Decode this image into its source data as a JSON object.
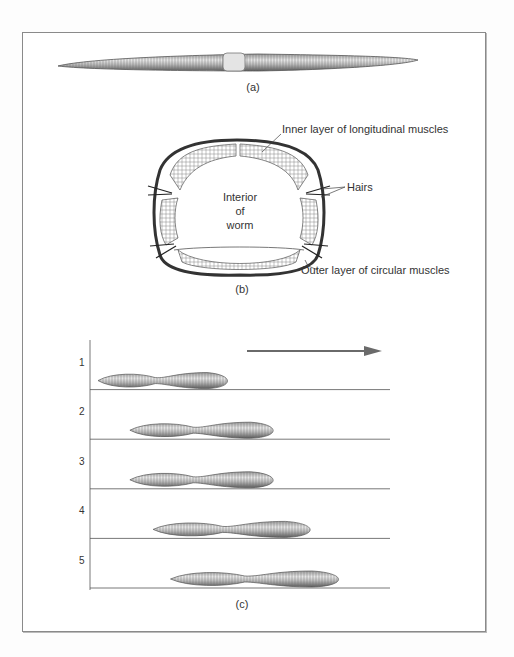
{
  "figure": {
    "panel_a": {
      "caption": "(a)"
    },
    "panel_b": {
      "caption": "(b)",
      "interior_label": [
        "Interior",
        "of",
        "worm"
      ],
      "labels": {
        "inner": "Inner layer of longitudinal muscles",
        "hairs": "Hairs",
        "outer": "Outer layer of circular muscles"
      }
    },
    "panel_c": {
      "caption": "(c)",
      "direction": "right",
      "steps": [
        {
          "n": "1",
          "start": 0.0,
          "end": 0.47
        },
        {
          "n": "2",
          "start": 0.11,
          "end": 0.63
        },
        {
          "n": "3",
          "start": 0.11,
          "end": 0.63
        },
        {
          "n": "4",
          "start": 0.19,
          "end": 0.76
        },
        {
          "n": "5",
          "start": 0.25,
          "end": 0.86
        }
      ]
    }
  }
}
